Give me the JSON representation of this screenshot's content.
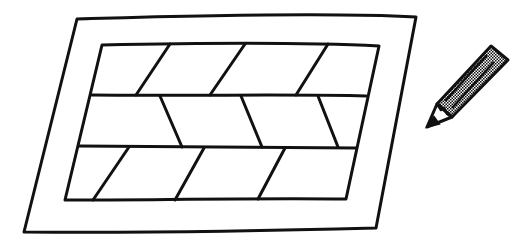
{
  "illustration": {
    "description": "Hand-drawn sketch of a parquet/brick-patterned rectangular tile with a pencil beside it",
    "colors": {
      "ink": "#111111",
      "background": "#ffffff",
      "pencil_fill": "#888888"
    },
    "objects": [
      "framed-pattern-tile",
      "pencil"
    ],
    "rows": 3
  }
}
